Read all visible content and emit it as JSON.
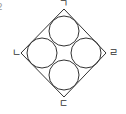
{
  "problem_marker": "2",
  "diagram": {
    "shape": "square rotated 45° with four inscribed tangent circles",
    "stroke_color": "#333333",
    "vertices": {
      "top": {
        "x": 64,
        "y": 9
      },
      "left": {
        "x": 21,
        "y": 53
      },
      "right": {
        "x": 106,
        "y": 53
      },
      "bottom": {
        "x": 64,
        "y": 97
      }
    },
    "circles": [
      {
        "name": "top",
        "cx": 64,
        "cy": 31,
        "r": 15
      },
      {
        "name": "left",
        "cx": 42,
        "cy": 53,
        "r": 15
      },
      {
        "name": "right",
        "cx": 86,
        "cy": 53,
        "r": 15
      },
      {
        "name": "bottom",
        "cx": 64,
        "cy": 75,
        "r": 15
      }
    ],
    "labels": {
      "top": "ㄱ",
      "left": "ㄴ",
      "right": "ㄹ",
      "bottom": "ㄷ"
    }
  }
}
